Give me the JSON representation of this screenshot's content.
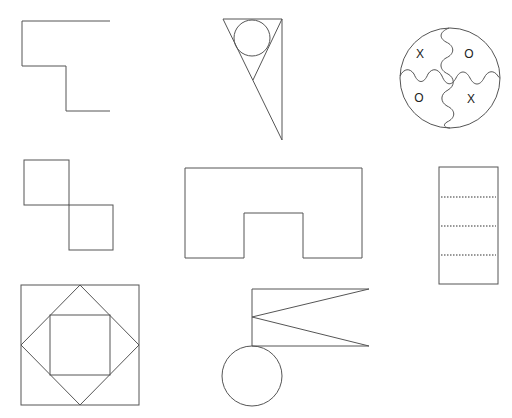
{
  "stroke_color": "#555555",
  "background_color": "#ffffff",
  "figures": [
    {
      "id": "step-line",
      "description": "Staircase polyline"
    },
    {
      "id": "triangle-with-circle",
      "description": "Right triangle with inscribed circle and inner V"
    },
    {
      "id": "tic-tac-toe-circle",
      "description": "Circle divided by wavy lines into four quadrants",
      "marks": [
        "X",
        "O",
        "O",
        "X"
      ]
    },
    {
      "id": "diagonal-squares",
      "description": "Two squares touching at a corner"
    },
    {
      "id": "u-shape",
      "description": "Rectangle with a notch cut out of the bottom"
    },
    {
      "id": "dotted-rectangle",
      "description": "Tall rectangle divided by three dotted lines",
      "dotted_lines": 3
    },
    {
      "id": "nested-squares",
      "description": "Square with inscribed diamond and inner square"
    },
    {
      "id": "flag-with-circle",
      "description": "Swallowtail flag on a pole over a circle"
    }
  ]
}
